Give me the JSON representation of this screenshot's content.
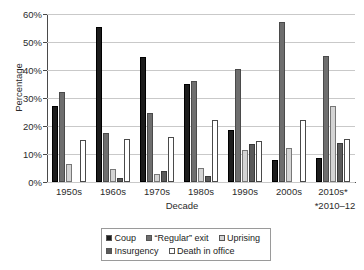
{
  "chart_data": {
    "type": "bar",
    "title": "",
    "xlabel": "Decade",
    "ylabel": "Percentage",
    "ylim": [
      0,
      60
    ],
    "yticks": [
      "0%",
      "10%",
      "20%",
      "30%",
      "40%",
      "50%",
      "60%"
    ],
    "ytick_values": [
      0,
      10,
      20,
      30,
      40,
      50,
      60
    ],
    "grid": true,
    "legend_position": "bottom",
    "categories": [
      "1950s",
      "1960s",
      "1970s",
      "1980s",
      "1990s",
      "2000s",
      "2010s*"
    ],
    "series": [
      {
        "name": "Coup",
        "color": "#1c1c1c",
        "values": [
          27,
          55.5,
          44.5,
          35,
          18.5,
          8,
          8.5
        ]
      },
      {
        "name": "“Regular” exit",
        "color": "#6e6e6e",
        "values": [
          32,
          17.5,
          24.5,
          36,
          40.5,
          57,
          45
        ]
      },
      {
        "name": "Uprising",
        "color": "#d4d4d4",
        "values": [
          6.5,
          4.5,
          3,
          5,
          11.5,
          12,
          27
        ]
      },
      {
        "name": "Insurgency",
        "color": "#5a5a5a",
        "values": [
          0,
          1.5,
          4,
          2,
          13.5,
          0,
          14
        ]
      },
      {
        "name": "Death in office",
        "color": "#ffffff",
        "values": [
          15,
          15.5,
          16,
          22,
          14.5,
          22,
          15.5
        ]
      }
    ],
    "footnote": "*2010–12"
  },
  "legend": {
    "rows": [
      [
        {
          "label": "Coup",
          "swatch": "coup-swatch"
        },
        {
          "label": "“Regular” exit",
          "swatch": "regular-exit-swatch"
        },
        {
          "label": "Uprising",
          "swatch": "uprising-swatch"
        }
      ],
      [
        {
          "label": "Insurgency",
          "swatch": "insurgency-swatch"
        },
        {
          "label": "Death in office",
          "swatch": "death-in-office-swatch"
        }
      ]
    ]
  }
}
